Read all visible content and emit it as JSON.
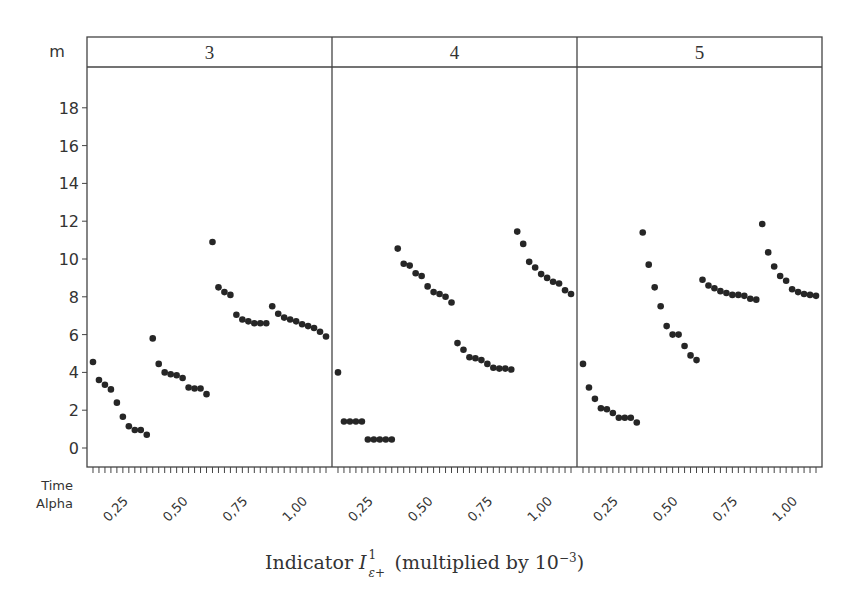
{
  "chart_data": {
    "type": "scatter",
    "title": "",
    "xlabel": "Indicator I_{ε+}^1 (multiplied by 10^-3)",
    "ylabel": "",
    "facet_variable": "m",
    "facets": [
      "3",
      "4",
      "5"
    ],
    "x_axis_rows": [
      "Time",
      "Alpha"
    ],
    "alpha_levels": [
      "0,25",
      "0,50",
      "0,75",
      "1,00"
    ],
    "time_points_per_alpha": 10,
    "ylim": [
      -1,
      20
    ],
    "yticks": [
      0,
      2,
      4,
      6,
      8,
      10,
      12,
      14,
      16,
      18
    ],
    "grid": false,
    "legend": null,
    "marker": "filled circle",
    "series": [
      {
        "name": "m=3, alpha=0,25",
        "facet": "3",
        "alpha": "0,25",
        "values": [
          4.55,
          3.6,
          3.35,
          3.1,
          2.4,
          1.65,
          1.15,
          0.95,
          0.95,
          0.7
        ]
      },
      {
        "name": "m=3, alpha=0,50",
        "facet": "3",
        "alpha": "0,50",
        "values": [
          5.8,
          4.45,
          4.0,
          3.9,
          3.85,
          3.7,
          3.2,
          3.15,
          3.15,
          2.85
        ]
      },
      {
        "name": "m=3, alpha=0,75",
        "facet": "3",
        "alpha": "0,75",
        "values": [
          10.9,
          8.5,
          8.25,
          8.1,
          7.05,
          6.8,
          6.7,
          6.6,
          6.6,
          6.6
        ]
      },
      {
        "name": "m=3, alpha=1,00",
        "facet": "3",
        "alpha": "1,00",
        "values": [
          7.5,
          7.1,
          6.9,
          6.8,
          6.7,
          6.55,
          6.45,
          6.35,
          6.15,
          5.9
        ]
      },
      {
        "name": "m=4, alpha=0,25",
        "facet": "4",
        "alpha": "0,25",
        "values": [
          4.0,
          1.4,
          1.4,
          1.4,
          1.4,
          0.45,
          0.45,
          0.45,
          0.45,
          0.45
        ]
      },
      {
        "name": "m=4, alpha=0,50",
        "facet": "4",
        "alpha": "0,50",
        "values": [
          10.55,
          9.75,
          9.65,
          9.25,
          9.1,
          8.55,
          8.25,
          8.15,
          8.0,
          7.7
        ]
      },
      {
        "name": "m=4, alpha=0,75",
        "facet": "4",
        "alpha": "0,75",
        "values": [
          5.55,
          5.2,
          4.8,
          4.75,
          4.65,
          4.45,
          4.25,
          4.2,
          4.2,
          4.15
        ]
      },
      {
        "name": "m=4, alpha=1,00",
        "facet": "4",
        "alpha": "1,00",
        "values": [
          11.45,
          10.8,
          9.85,
          9.55,
          9.2,
          9.0,
          8.8,
          8.7,
          8.35,
          8.15
        ]
      },
      {
        "name": "m=5, alpha=0,25",
        "facet": "5",
        "alpha": "0,25",
        "values": [
          4.45,
          3.2,
          2.6,
          2.1,
          2.05,
          1.85,
          1.6,
          1.6,
          1.6,
          1.35
        ]
      },
      {
        "name": "m=5, alpha=0,50",
        "facet": "5",
        "alpha": "0,50",
        "values": [
          11.4,
          9.7,
          8.5,
          7.5,
          6.45,
          6.0,
          6.0,
          5.4,
          4.9,
          4.65
        ]
      },
      {
        "name": "m=5, alpha=0,75",
        "facet": "5",
        "alpha": "0,75",
        "values": [
          8.9,
          8.6,
          8.45,
          8.3,
          8.2,
          8.1,
          8.1,
          8.05,
          7.9,
          7.85
        ]
      },
      {
        "name": "m=5, alpha=1,00",
        "facet": "5",
        "alpha": "1,00",
        "values": [
          11.85,
          10.35,
          9.6,
          9.1,
          8.85,
          8.4,
          8.25,
          8.15,
          8.1,
          8.05
        ]
      }
    ]
  },
  "labels": {
    "facet_header": "m",
    "row_time": "Time",
    "row_alpha": "Alpha",
    "x_title_prefix": "Indicator ",
    "x_title_symbol": "I",
    "x_title_sup": "1",
    "x_title_sub": "ε+",
    "x_title_middle": " (multiplied by 10",
    "x_title_exp": "−3",
    "x_title_suffix": ")"
  },
  "colors": {
    "marker": "#262626",
    "frame": "#444444",
    "text": "#333333"
  }
}
